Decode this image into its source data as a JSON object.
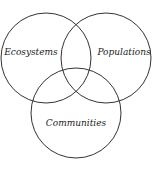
{
  "diagram": {
    "type": "venn",
    "stroke_color": "#333333",
    "sets": [
      {
        "label": "Ecosystems",
        "cx": 46,
        "cy": 58,
        "r": 45,
        "label_x": 31,
        "label_y": 55
      },
      {
        "label": "Populations",
        "cx": 106,
        "cy": 58,
        "r": 45,
        "label_x": 124,
        "label_y": 55
      },
      {
        "label": "Communities",
        "cx": 76,
        "cy": 113,
        "r": 45,
        "label_x": 76,
        "label_y": 126
      }
    ]
  }
}
